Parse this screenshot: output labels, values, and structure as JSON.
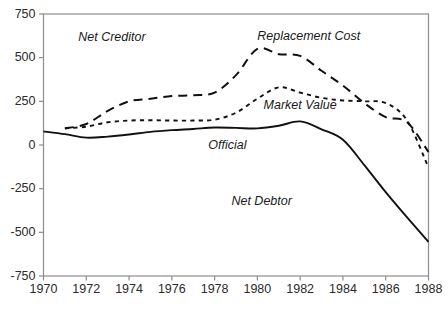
{
  "chart_data": {
    "type": "line",
    "title": "",
    "subtitle": "",
    "xlabel": "",
    "ylabel": "",
    "xlim": [
      1970,
      1988
    ],
    "ylim": [
      -750,
      750
    ],
    "grid": false,
    "legend": "inline-annotations",
    "x_ticks": [
      "1970",
      "1972",
      "1974",
      "1976",
      "1978",
      "1980",
      "1982",
      "1984",
      "1986",
      "1988"
    ],
    "x_tick_values": [
      1970,
      1972,
      1974,
      1976,
      1978,
      1980,
      1982,
      1984,
      1986,
      1988
    ],
    "y_ticks": [
      "750",
      "500",
      "250",
      "0",
      "-250",
      "-500",
      "-750"
    ],
    "y_tick_values": [
      750,
      500,
      250,
      0,
      -250,
      -500,
      -750
    ],
    "annotations": [
      {
        "text": "Net Creditor",
        "x": 1973.2,
        "y": 595
      },
      {
        "text": "Net Debtor",
        "x": 1980.2,
        "y": -345
      },
      {
        "text": "Replacement Cost",
        "x": 1982.4,
        "y": 600
      },
      {
        "text": "Market Value",
        "x": 1982.0,
        "y": 205
      },
      {
        "text": "Official",
        "x": 1978.6,
        "y": -25
      }
    ],
    "series": [
      {
        "name": "Official",
        "style": "solid",
        "color": "#111111",
        "x": [
          1970,
          1971,
          1972,
          1973,
          1974,
          1975,
          1976,
          1977,
          1978,
          1979,
          1980,
          1981,
          1982,
          1983,
          1984,
          1985,
          1986,
          1987,
          1988
        ],
        "values": [
          78,
          62,
          42,
          48,
          60,
          75,
          85,
          92,
          100,
          98,
          95,
          110,
          135,
          90,
          30,
          -115,
          -270,
          -415,
          -555
        ]
      },
      {
        "name": "Market Value",
        "style": "short-dash",
        "color": "#111111",
        "x": [
          1971,
          1972,
          1973,
          1974,
          1975,
          1976,
          1977,
          1978,
          1979,
          1980,
          1981,
          1982,
          1983,
          1984,
          1985,
          1986,
          1987,
          1988
        ],
        "values": [
          95,
          105,
          130,
          140,
          142,
          140,
          140,
          145,
          185,
          265,
          330,
          300,
          270,
          255,
          250,
          240,
          140,
          -130
        ]
      },
      {
        "name": "Replacement Cost",
        "style": "long-dash",
        "color": "#111111",
        "x": [
          1971,
          1972,
          1973,
          1974,
          1975,
          1976,
          1977,
          1978,
          1979,
          1980,
          1981,
          1982,
          1983,
          1984,
          1985,
          1986,
          1987,
          1988
        ],
        "values": [
          95,
          120,
          195,
          250,
          265,
          280,
          285,
          300,
          400,
          550,
          520,
          510,
          425,
          340,
          240,
          160,
          130,
          -40
        ]
      }
    ]
  }
}
